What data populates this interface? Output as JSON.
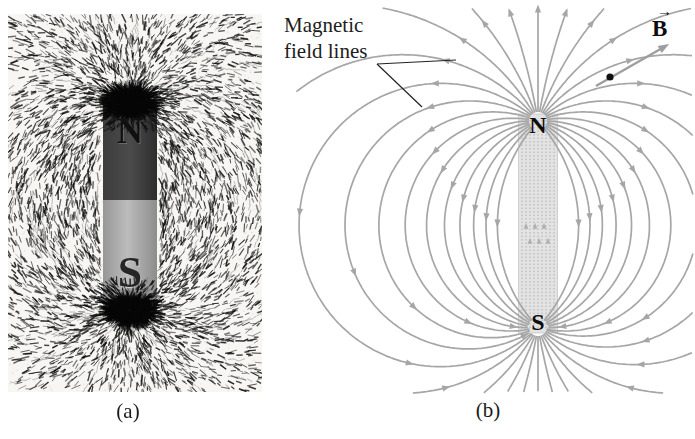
{
  "figure": {
    "panel_a": {
      "caption": "(a)",
      "north_label": "N",
      "south_label": "S"
    },
    "panel_b": {
      "caption": "(b)",
      "annotation_label": "Magnetic field lines",
      "north_label": "N",
      "south_label": "S",
      "field_vector_label": "B",
      "vector_arrow_glyph": "→",
      "colors": {
        "field_line": "#a6a6a6",
        "magnet_fill": "#e3e3e3",
        "magnet_edge": "#c8c8c8",
        "magnet_inner_line": "#b0b0b0",
        "pointer_line": "#222222",
        "vector_arrow": "#9e9e9e",
        "dot": "#111111"
      }
    }
  }
}
